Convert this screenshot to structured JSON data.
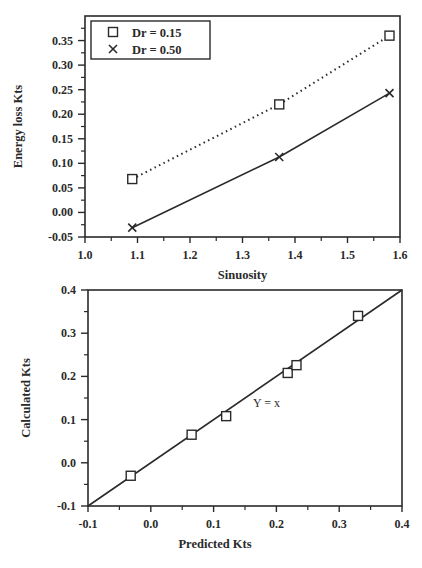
{
  "chart_data": [
    {
      "type": "line",
      "title": "",
      "xlabel": "Sinuosity",
      "ylabel": "Energy loss Kts",
      "xlim": [
        1.0,
        1.6
      ],
      "ylim": [
        -0.05,
        0.4
      ],
      "x_ticks": [
        "1.0",
        "1.1",
        "1.2",
        "1.3",
        "1.4",
        "1.5",
        "1.6"
      ],
      "y_ticks": [
        "-0.05",
        "0.00",
        "0.05",
        "0.10",
        "0.15",
        "0.20",
        "0.25",
        "0.30",
        "0.35"
      ],
      "grid": false,
      "legend_position": "upper left",
      "series": [
        {
          "name": "Dr = 0.15",
          "marker": "square",
          "line": "dotted",
          "x": [
            1.09,
            1.37,
            1.58
          ],
          "values": [
            0.068,
            0.22,
            0.36
          ]
        },
        {
          "name": "Dr = 0.50",
          "marker": "x",
          "line": "solid",
          "x": [
            1.09,
            1.37,
            1.58
          ],
          "values": [
            -0.031,
            0.113,
            0.243
          ]
        }
      ]
    },
    {
      "type": "scatter",
      "title": "",
      "xlabel": "Predicted Kts",
      "ylabel": "Calculated Kts",
      "xlim": [
        -0.1,
        0.4
      ],
      "ylim": [
        -0.1,
        0.4
      ],
      "x_ticks": [
        "-0.1",
        "0.0",
        "0.1",
        "0.2",
        "0.3",
        "0.4"
      ],
      "y_ticks": [
        "-0.1",
        "0.0",
        "0.1",
        "0.2",
        "0.3",
        "0.4"
      ],
      "grid": false,
      "annotations": [
        "Y = x"
      ],
      "series": [
        {
          "name": "data",
          "marker": "square",
          "x": [
            -0.032,
            0.065,
            0.12,
            0.218,
            0.232,
            0.33
          ],
          "values": [
            -0.03,
            0.065,
            0.108,
            0.208,
            0.226,
            0.34
          ]
        },
        {
          "name": "Y = x",
          "line": "solid",
          "x": [
            -0.1,
            0.4
          ],
          "values": [
            -0.1,
            0.4
          ]
        }
      ]
    }
  ]
}
